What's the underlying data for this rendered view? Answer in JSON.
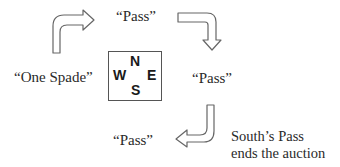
{
  "diagram": {
    "type": "bridge-auction-sequence",
    "compass": {
      "north": "N",
      "west": "W",
      "east": "E",
      "south": "S"
    },
    "bids": {
      "west": "“One Spade”",
      "north": "“Pass”",
      "east": "“Pass”",
      "south": "“Pass”"
    },
    "note": {
      "line1": "South’s Pass",
      "line2": "ends the auction"
    },
    "arrows": [
      {
        "from": "west",
        "to": "north",
        "direction": "clockwise"
      },
      {
        "from": "north",
        "to": "east",
        "direction": "clockwise"
      },
      {
        "from": "east",
        "to": "south",
        "direction": "clockwise"
      }
    ],
    "colors": {
      "text": "#2a2a2a",
      "outline": "#555555",
      "background": "#ffffff"
    }
  }
}
